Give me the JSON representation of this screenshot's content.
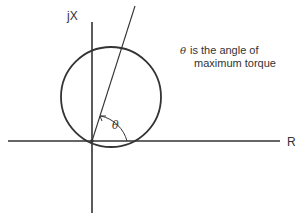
{
  "diagram": {
    "axes": {
      "vertical_label": "jX",
      "horizontal_label": "R"
    },
    "angle_symbol": "θ",
    "note": {
      "symbol": "θ",
      "line1": "is the angle of",
      "line2": "maximum torque"
    },
    "colors": {
      "stroke": "#333333",
      "background": "#ffffff"
    }
  }
}
